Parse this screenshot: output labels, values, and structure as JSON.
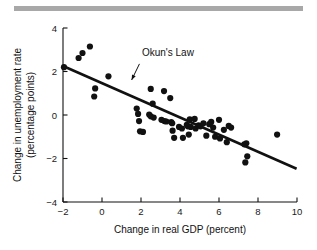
{
  "figure": {
    "name": "okuns-law-scatter",
    "decor_bar_color": "#a8a8a8"
  },
  "chart_data": {
    "type": "scatter",
    "title": "",
    "xlabel": "Change in real GDP (percent)",
    "ylabel_line1": "Change in unemployment rate",
    "ylabel_line2": "(percentage points)",
    "xlim": [
      -2,
      10
    ],
    "ylim": [
      -4,
      4
    ],
    "xticks": [
      -2,
      0,
      2,
      4,
      6,
      8,
      10
    ],
    "xticklabels": [
      "−2",
      "0",
      "2",
      "4",
      "6",
      "8",
      "10"
    ],
    "yticks": [
      -4,
      -2,
      0,
      2,
      4
    ],
    "yticklabels": [
      "−4",
      "−2",
      "0",
      "2",
      "4"
    ],
    "grid": false,
    "legend": "none",
    "marker_color": "#111111",
    "marker_size": 3.1,
    "annotations": [
      {
        "text": "Okun's Law",
        "text_x": 2.05,
        "text_y": 2.72,
        "arrow_from_x": 1.92,
        "arrow_from_y": 2.35,
        "arrow_to_x": 1.52,
        "arrow_to_y": 1.61
      }
    ],
    "fit_line": {
      "name": "Okun's Law regression line",
      "color": "#111111",
      "width": 2.6,
      "x_start": -2.0,
      "y_start": 2.25,
      "x_end": 9.98,
      "y_end": -2.47
    },
    "points": [
      {
        "x": -1.95,
        "y": 2.2
      },
      {
        "x": -1.2,
        "y": 2.62
      },
      {
        "x": -1.0,
        "y": 2.85
      },
      {
        "x": -0.62,
        "y": 3.15
      },
      {
        "x": -0.35,
        "y": 1.22
      },
      {
        "x": -0.4,
        "y": 0.85
      },
      {
        "x": 0.33,
        "y": 1.78
      },
      {
        "x": 1.78,
        "y": 0.3
      },
      {
        "x": 1.85,
        "y": 0.05
      },
      {
        "x": 1.9,
        "y": -0.28
      },
      {
        "x": 1.95,
        "y": -0.75
      },
      {
        "x": 2.1,
        "y": -0.78
      },
      {
        "x": 2.5,
        "y": 1.2
      },
      {
        "x": 2.42,
        "y": 0.02
      },
      {
        "x": 2.5,
        "y": -0.06
      },
      {
        "x": 2.6,
        "y": 0.52
      },
      {
        "x": 2.65,
        "y": -0.12
      },
      {
        "x": 3.05,
        "y": -0.22
      },
      {
        "x": 3.18,
        "y": 1.1
      },
      {
        "x": 3.2,
        "y": -0.28
      },
      {
        "x": 3.3,
        "y": -0.3
      },
      {
        "x": 3.5,
        "y": 0.78
      },
      {
        "x": 3.55,
        "y": -0.33
      },
      {
        "x": 3.6,
        "y": -0.38
      },
      {
        "x": 3.62,
        "y": -0.72
      },
      {
        "x": 3.7,
        "y": -1.05
      },
      {
        "x": 3.95,
        "y": -0.55
      },
      {
        "x": 4.1,
        "y": -0.62
      },
      {
        "x": 4.15,
        "y": -1.05
      },
      {
        "x": 4.35,
        "y": -0.45
      },
      {
        "x": 4.4,
        "y": -0.52
      },
      {
        "x": 4.45,
        "y": -0.9
      },
      {
        "x": 4.5,
        "y": -0.2
      },
      {
        "x": 4.55,
        "y": -0.55
      },
      {
        "x": 4.75,
        "y": -0.18
      },
      {
        "x": 4.8,
        "y": -0.62
      },
      {
        "x": 4.95,
        "y": -0.48
      },
      {
        "x": 5.05,
        "y": -0.52
      },
      {
        "x": 5.2,
        "y": -0.38
      },
      {
        "x": 5.35,
        "y": -0.95
      },
      {
        "x": 5.5,
        "y": -0.42
      },
      {
        "x": 5.6,
        "y": -0.32
      },
      {
        "x": 5.7,
        "y": -0.58
      },
      {
        "x": 5.8,
        "y": -1.0
      },
      {
        "x": 6.0,
        "y": -0.22
      },
      {
        "x": 6.05,
        "y": -1.08
      },
      {
        "x": 6.25,
        "y": -0.68
      },
      {
        "x": 6.4,
        "y": -1.25
      },
      {
        "x": 6.5,
        "y": -0.5
      },
      {
        "x": 6.62,
        "y": -0.58
      },
      {
        "x": 7.3,
        "y": -1.35
      },
      {
        "x": 7.4,
        "y": -1.3
      },
      {
        "x": 7.45,
        "y": -1.9
      },
      {
        "x": 7.35,
        "y": -2.18
      },
      {
        "x": 8.98,
        "y": -0.9
      }
    ]
  }
}
